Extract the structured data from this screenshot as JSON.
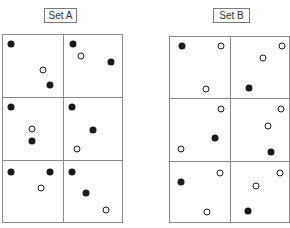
{
  "sets": [
    {
      "label": "Set A",
      "label_box": {
        "x": 44,
        "y": 8,
        "w": 33,
        "h": 15
      },
      "grid": {
        "x": 2,
        "y": 34,
        "w": 121,
        "h": 189,
        "cols": 2,
        "rows": 3
      },
      "dots": [
        {
          "x": 11,
          "y": 44,
          "type": "filled"
        },
        {
          "x": 43,
          "y": 70,
          "type": "open"
        },
        {
          "x": 50,
          "y": 85,
          "type": "filled"
        },
        {
          "x": 73,
          "y": 44,
          "type": "filled"
        },
        {
          "x": 81,
          "y": 56,
          "type": "open"
        },
        {
          "x": 111,
          "y": 62,
          "type": "filled"
        },
        {
          "x": 11,
          "y": 107,
          "type": "filled"
        },
        {
          "x": 32,
          "y": 129,
          "type": "open"
        },
        {
          "x": 32,
          "y": 141,
          "type": "filled"
        },
        {
          "x": 72,
          "y": 107,
          "type": "filled"
        },
        {
          "x": 93,
          "y": 130,
          "type": "filled"
        },
        {
          "x": 77,
          "y": 149,
          "type": "open"
        },
        {
          "x": 11,
          "y": 172,
          "type": "filled"
        },
        {
          "x": 50,
          "y": 172,
          "type": "filled"
        },
        {
          "x": 41,
          "y": 188,
          "type": "open"
        },
        {
          "x": 72,
          "y": 172,
          "type": "filled"
        },
        {
          "x": 86,
          "y": 193,
          "type": "filled"
        },
        {
          "x": 106,
          "y": 210,
          "type": "open"
        }
      ]
    },
    {
      "label": "Set B",
      "label_box": {
        "x": 213,
        "y": 8,
        "w": 37,
        "h": 15
      },
      "grid": {
        "x": 169,
        "y": 36,
        "w": 121,
        "h": 187,
        "cols": 2,
        "rows": 3
      },
      "dots": [
        {
          "x": 182,
          "y": 46,
          "type": "filled"
        },
        {
          "x": 221,
          "y": 46,
          "type": "open"
        },
        {
          "x": 206,
          "y": 89,
          "type": "open"
        },
        {
          "x": 282,
          "y": 46,
          "type": "open"
        },
        {
          "x": 263,
          "y": 58,
          "type": "open"
        },
        {
          "x": 249,
          "y": 88,
          "type": "filled"
        },
        {
          "x": 221,
          "y": 109,
          "type": "open"
        },
        {
          "x": 215,
          "y": 138,
          "type": "filled"
        },
        {
          "x": 181,
          "y": 149,
          "type": "open"
        },
        {
          "x": 281,
          "y": 109,
          "type": "open"
        },
        {
          "x": 268,
          "y": 126,
          "type": "open"
        },
        {
          "x": 271,
          "y": 152,
          "type": "filled"
        },
        {
          "x": 220,
          "y": 173,
          "type": "open"
        },
        {
          "x": 181,
          "y": 182,
          "type": "filled"
        },
        {
          "x": 207,
          "y": 212,
          "type": "open"
        },
        {
          "x": 280,
          "y": 173,
          "type": "open"
        },
        {
          "x": 256,
          "y": 186,
          "type": "open"
        },
        {
          "x": 248,
          "y": 211,
          "type": "filled"
        }
      ]
    }
  ]
}
